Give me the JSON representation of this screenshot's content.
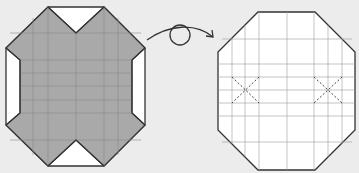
{
  "diagram": {
    "type": "origami-step",
    "colors": {
      "background": "#ececec",
      "paper_colored": "#a9a9a9",
      "paper_white": "#ffffff",
      "outline": "#333333",
      "crease": "#777777",
      "dashed_crease": "#444444"
    },
    "left_model": {
      "label": "before-turn-over",
      "shape": "octagon",
      "shaded": true
    },
    "action": {
      "symbol": "turn-over-arrow",
      "label": ""
    },
    "right_model": {
      "label": "after-turn-over",
      "shape": "octagon",
      "shaded": false,
      "x_marks": 2
    }
  }
}
